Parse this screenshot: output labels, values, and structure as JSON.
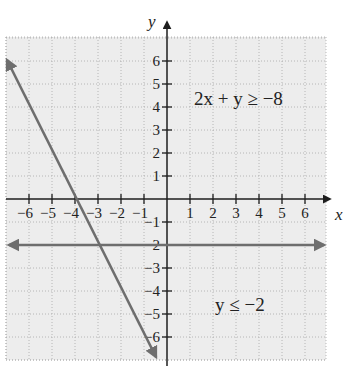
{
  "chart_data": {
    "type": "line",
    "title": "",
    "xlabel": "x",
    "ylabel": "y",
    "xlim": [
      -7,
      7
    ],
    "ylim": [
      -7,
      7
    ],
    "grid": true,
    "x_ticks": [
      -6,
      -5,
      -4,
      -3,
      -2,
      -1,
      1,
      2,
      3,
      4,
      5,
      6
    ],
    "y_ticks": [
      6,
      5,
      4,
      3,
      2,
      1,
      -1,
      -2,
      -3,
      -4,
      -5,
      -6
    ],
    "x_tick_labels": [
      "−6",
      "−5",
      "−4",
      "−3",
      "−2",
      "−1",
      "1",
      "2",
      "3",
      "4",
      "5",
      "6"
    ],
    "y_tick_labels": [
      "6",
      "5",
      "4",
      "3",
      "2",
      "1",
      "−1",
      "−2",
      "−3",
      "−4",
      "−5",
      "−6"
    ],
    "series": [
      {
        "name": "2x + y = −8",
        "equation": "y = -2x - 8",
        "points": [
          [
            -7,
            6
          ],
          [
            -4,
            0
          ],
          [
            -3,
            -2
          ],
          [
            -0.5,
            -7
          ]
        ],
        "color": "#6e6e6e"
      },
      {
        "name": "y = −2",
        "equation": "y = -2",
        "points": [
          [
            -7,
            -2
          ],
          [
            6.9,
            -2
          ]
        ],
        "color": "#6e6e6e"
      }
    ],
    "annotations": [
      {
        "text": "2x + y ≥ −8",
        "x": 3.5,
        "y": 4.6
      },
      {
        "text": "y ≤ −2",
        "x": 3.6,
        "y": -4.7
      }
    ],
    "shaded_region": "entire plotted grid shaded light gray",
    "legend": "none"
  },
  "colors": {
    "background": "#ffffff",
    "shade": "#ededed",
    "grid": "#a8a8a8",
    "axis": "#2a2a2a",
    "boundary_line": "#6e6e6e"
  }
}
